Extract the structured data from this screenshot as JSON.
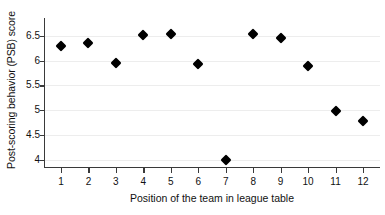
{
  "chart_data": {
    "type": "scatter",
    "title": "",
    "xlabel": "Position of the team in league table",
    "ylabel": "Post-scoring behavior (PSB) score",
    "x": [
      1,
      2,
      3,
      4,
      5,
      6,
      7,
      8,
      9,
      10,
      11,
      12
    ],
    "values": [
      6.29,
      6.36,
      5.96,
      6.51,
      6.53,
      5.93,
      4.0,
      6.53,
      6.45,
      5.89,
      4.99,
      4.78
    ],
    "series": [
      {
        "name": "PSB score",
        "values": [
          6.29,
          6.36,
          5.96,
          6.51,
          6.53,
          5.93,
          4.0,
          6.53,
          6.45,
          5.89,
          4.99,
          4.78
        ]
      }
    ],
    "xtick_labels": [
      "1",
      "2",
      "3",
      "4",
      "5",
      "6",
      "7",
      "8",
      "9",
      "10",
      "11",
      "12"
    ],
    "ytick_labels": [
      "4",
      "4.5",
      "5",
      "5.5",
      "6",
      "6.5"
    ],
    "ytick_values": [
      4,
      4.5,
      5,
      5.5,
      6,
      6.5
    ],
    "xlim": [
      0.6,
      12.4
    ],
    "ylim": [
      3.85,
      6.72
    ],
    "grid": "horizontal",
    "legend": "none",
    "marker": "diamond",
    "marker_color": "#000000",
    "axis_color": "#3a3a3a",
    "grid_color": "#ededed",
    "background": "#ffffff"
  }
}
